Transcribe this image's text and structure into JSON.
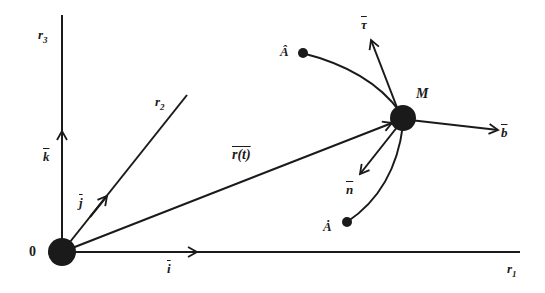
{
  "diagram": {
    "colors": {
      "ink": "#1a1a1a",
      "background": "#ffffff"
    },
    "axes": {
      "r1": {
        "label": "r",
        "sub": "1"
      },
      "r2": {
        "label": "r",
        "sub": "2"
      },
      "r3": {
        "label": "r",
        "sub": "3"
      }
    },
    "origin": {
      "label": "0"
    },
    "unit_vectors": {
      "i": "i",
      "j": "j",
      "k": "k"
    },
    "position_vector": {
      "label": "r(t)"
    },
    "point_M": {
      "label": "M"
    },
    "curve_points": {
      "A_hat": "Â",
      "A_dot": "Ȧ"
    },
    "frame_vectors": {
      "tau": "τ",
      "b": "b",
      "n": "n"
    }
  }
}
